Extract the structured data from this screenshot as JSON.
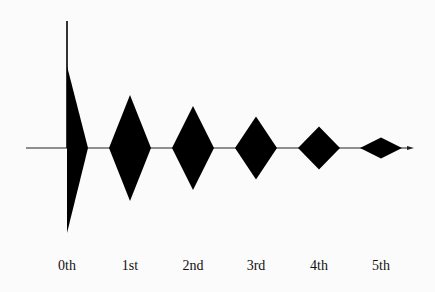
{
  "diagram": {
    "type": "order-decay",
    "colors": {
      "fill": "#000000",
      "axis": "#222222",
      "background": "#fbfbfb"
    },
    "orders": [
      {
        "label": "0th",
        "relative_magnitude": 1.0,
        "shape": "half-diamond-with-spike"
      },
      {
        "label": "1st",
        "relative_magnitude": 0.63,
        "shape": "diamond"
      },
      {
        "label": "2nd",
        "relative_magnitude": 0.5,
        "shape": "diamond"
      },
      {
        "label": "3rd",
        "relative_magnitude": 0.375,
        "shape": "diamond"
      },
      {
        "label": "4th",
        "relative_magnitude": 0.255,
        "shape": "diamond"
      },
      {
        "label": "5th",
        "relative_magnitude": 0.125,
        "shape": "diamond"
      }
    ]
  }
}
